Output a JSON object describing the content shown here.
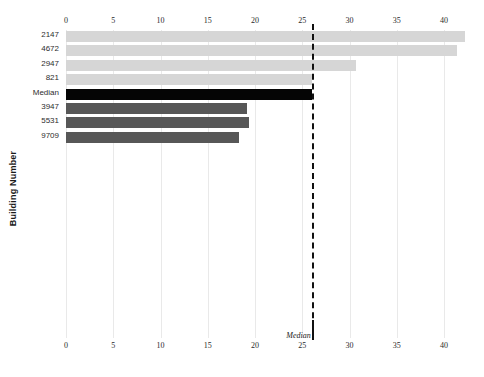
{
  "chart_data": {
    "type": "bar",
    "orientation": "horizontal",
    "title": "",
    "xlabel": "",
    "ylabel": "Building Number",
    "categories": [
      "2147",
      "4672",
      "2947",
      "821",
      "Median",
      "3947",
      "5531",
      "9709"
    ],
    "values": [
      42.2,
      41.4,
      30.7,
      26.0,
      26.0,
      19.2,
      19.4,
      18.3
    ],
    "bar_colors": [
      "#d6d6d6",
      "#d6d6d6",
      "#d6d6d6",
      "#d6d6d6",
      "#050505",
      "#575757",
      "#575757",
      "#575757"
    ],
    "xlim": [
      0,
      42.8
    ],
    "xticks": [
      0,
      5,
      10,
      15,
      20,
      25,
      30,
      35,
      40
    ],
    "xtick_labels": [
      "0",
      "5",
      "10",
      "15",
      "20",
      "25",
      "30",
      "35",
      "40"
    ],
    "xaxis_top": true,
    "xaxis_bottom": true,
    "grid": true,
    "grid_color": "#e9e9e9",
    "legend": "none",
    "annotations": [
      {
        "name": "median-reference-line",
        "label": "Median",
        "value": 26.0,
        "style": "dashed",
        "color": "#111111"
      }
    ],
    "series": [
      {
        "name": "Building value",
        "points": [
          {
            "category": "2147",
            "value": 42.2,
            "color": "#d6d6d6"
          },
          {
            "category": "4672",
            "value": 41.4,
            "color": "#d6d6d6"
          },
          {
            "category": "2947",
            "value": 30.7,
            "color": "#d6d6d6"
          },
          {
            "category": "821",
            "value": 26.0,
            "color": "#d6d6d6"
          },
          {
            "category": "Median",
            "value": 26.0,
            "color": "#050505"
          },
          {
            "category": "3947",
            "value": 19.2,
            "color": "#575757"
          },
          {
            "category": "5531",
            "value": 19.4,
            "color": "#575757"
          },
          {
            "category": "9709",
            "value": 18.3,
            "color": "#575757"
          }
        ]
      }
    ]
  },
  "axis": {
    "y_title": "Building Number"
  },
  "colors": {
    "background": "#ffffff",
    "grid": "#e9e9e9",
    "light_bar": "#d6d6d6",
    "dark_bar": "#575757",
    "median_bar": "#050505",
    "median_line": "#111111",
    "text": "#2a2a2a"
  }
}
